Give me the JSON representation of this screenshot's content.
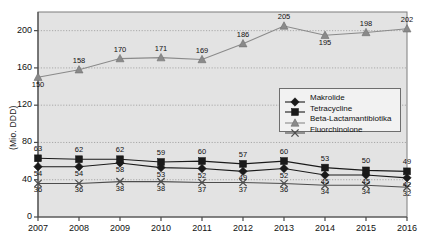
{
  "chart_data": {
    "type": "line",
    "title": "",
    "xlabel": "",
    "ylabel": "(Mio. DDD)",
    "categories": [
      "2007",
      "2008",
      "2009",
      "2010",
      "2011",
      "2012",
      "2013",
      "2014",
      "2015",
      "2016"
    ],
    "ylim": [
      0,
      220
    ],
    "yticks": [
      0,
      40,
      80,
      120,
      160,
      200
    ],
    "grid": "horizontal-dotted",
    "legend_position": "inside-center-right",
    "series": [
      {
        "name": "Makrolide",
        "marker": "diamond",
        "color": "#1a1a1a",
        "values": [
          54,
          54,
          58,
          53,
          52,
          49,
          52,
          45,
          45,
          42
        ]
      },
      {
        "name": "Tetracycline",
        "marker": "square",
        "color": "#1a1a1a",
        "values": [
          63,
          62,
          62,
          59,
          60,
          57,
          60,
          53,
          50,
          49
        ]
      },
      {
        "name": "Beta-Lactamantibiotika",
        "marker": "triangle",
        "color": "#8a8a8a",
        "values": [
          150,
          158,
          170,
          171,
          169,
          186,
          205,
          195,
          198,
          202
        ]
      },
      {
        "name": "Fluorchinolone",
        "marker": "x",
        "color": "#4d4d4d",
        "values": [
          36,
          36,
          38,
          38,
          37,
          37,
          36,
          34,
          34,
          32
        ]
      }
    ]
  },
  "colors": {
    "plot_background": "#e3e3e3",
    "axis": "#4a4a4a",
    "gridline": "#9a9a9a",
    "legend_background": "#f2f2f2",
    "legend_border": "#6e6e6e",
    "text": "#111111"
  }
}
